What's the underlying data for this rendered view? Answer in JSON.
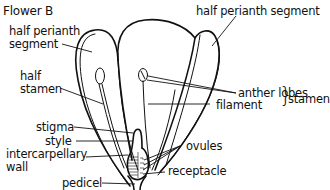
{
  "figure": {
    "title": "Flower B",
    "type": "longitudinal section of flower",
    "labels": {
      "half_perianth_left_line1": "half perianth",
      "half_perianth_left_line2": "segment",
      "half_perianth_right": "half perianth segment",
      "half_stamen_line1": "half",
      "half_stamen_line2": "stamen",
      "anther_lobes": "anther lobes",
      "filament": "filament",
      "stamen_group": "stamen",
      "stigma": "stigma",
      "style": "style",
      "intercarpellary_line1": "intercarpellary",
      "intercarpellary_line2": "wall",
      "ovules": "ovules",
      "receptacle": "receptacle",
      "pedicel": "pedicel"
    }
  }
}
